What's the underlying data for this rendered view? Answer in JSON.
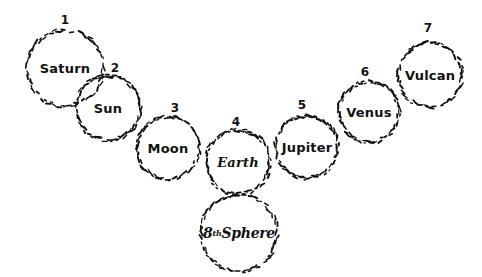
{
  "diagram": {
    "background_color": "#ffffff",
    "ink_color": "#111111",
    "style": "hand-drawn dotted circles",
    "width": 482,
    "height": 277,
    "nodes": [
      {
        "id": "saturn",
        "number": "1",
        "label": "Saturn",
        "label_style": "upright",
        "cx": 65,
        "cy": 68,
        "r": 38,
        "num_x": 65,
        "num_y": 14
      },
      {
        "id": "sun",
        "number": "2",
        "label": "Sun",
        "label_style": "upright",
        "cx": 108,
        "cy": 108,
        "r": 32,
        "num_x": 115,
        "num_y": 62
      },
      {
        "id": "moon",
        "number": "3",
        "label": "Moon",
        "label_style": "upright",
        "cx": 168,
        "cy": 148,
        "r": 31,
        "num_x": 175,
        "num_y": 102
      },
      {
        "id": "earth",
        "number": "4",
        "label": "Earth",
        "label_style": "slanted",
        "cx": 238,
        "cy": 162,
        "r": 32,
        "num_x": 236,
        "num_y": 116
      },
      {
        "id": "jupiter",
        "number": "5",
        "label": "Jupiter",
        "label_style": "upright",
        "cx": 307,
        "cy": 147,
        "r": 31,
        "num_x": 302,
        "num_y": 99
      },
      {
        "id": "venus",
        "number": "6",
        "label": "Venus",
        "label_style": "upright",
        "cx": 369,
        "cy": 112,
        "r": 30,
        "num_x": 365,
        "num_y": 66
      },
      {
        "id": "vulcan",
        "number": "7",
        "label": "Vulcan",
        "label_style": "upright",
        "cx": 430,
        "cy": 75,
        "r": 32,
        "num_x": 428,
        "num_y": 22
      },
      {
        "id": "eighth-sphere",
        "number": "",
        "label_html": "8<sup>th</sup> Sphere",
        "label": "8th Sphere",
        "label_style": "script",
        "cx": 239,
        "cy": 233,
        "r": 38,
        "num_x": 0,
        "num_y": 0
      }
    ]
  }
}
